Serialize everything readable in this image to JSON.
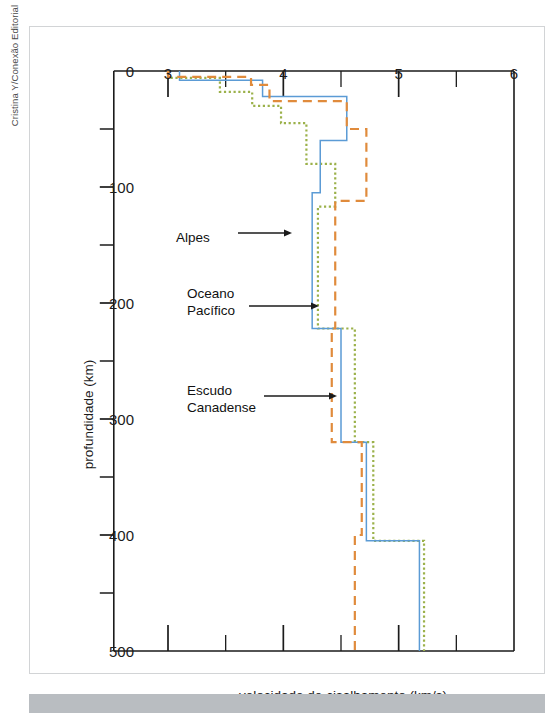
{
  "credit": "Cristina Y/Conexão Editorial",
  "chart_data": {
    "type": "line",
    "title": "",
    "xlabel": "velocidade de cisalhamento (km/s)",
    "ylabel": "profundidade (km)",
    "xlim": [
      2.53,
      6.0
    ],
    "ylim": [
      0,
      500
    ],
    "y_inverted": true,
    "x_axis_position": "top",
    "grid": false,
    "legend_position": "inline-annotations",
    "xticks": [
      3,
      4,
      5,
      6
    ],
    "xtick_labels": [
      "3",
      "4",
      "5",
      "6"
    ],
    "x_minor_ticks": [
      3.5,
      4.5,
      5.5
    ],
    "yticks": [
      0,
      100,
      200,
      300,
      400,
      500
    ],
    "ytick_labels": [
      "0",
      "100",
      "200",
      "300",
      "400",
      "500"
    ],
    "y_minor_ticks": [
      50,
      150,
      250,
      350,
      450
    ],
    "series": [
      {
        "name": "Alpes",
        "color": "#9bb14a",
        "style": "dotted",
        "points": [
          [
            3.0,
            0
          ],
          [
            3.0,
            6
          ],
          [
            3.45,
            6
          ],
          [
            3.45,
            18
          ],
          [
            3.73,
            18
          ],
          [
            3.73,
            30
          ],
          [
            3.98,
            30
          ],
          [
            3.98,
            45
          ],
          [
            4.2,
            45
          ],
          [
            4.2,
            80
          ],
          [
            4.45,
            80
          ],
          [
            4.45,
            117
          ],
          [
            4.3,
            117
          ],
          [
            4.3,
            222
          ],
          [
            4.62,
            222
          ],
          [
            4.62,
            320
          ],
          [
            4.78,
            320
          ],
          [
            4.78,
            405
          ],
          [
            5.22,
            405
          ],
          [
            5.22,
            500
          ]
        ]
      },
      {
        "name": "Oceano Pacífico",
        "color": "#5b9bd5",
        "style": "solid",
        "points": [
          [
            3.1,
            0
          ],
          [
            3.1,
            8
          ],
          [
            3.82,
            8
          ],
          [
            3.82,
            22
          ],
          [
            4.55,
            22
          ],
          [
            4.55,
            60
          ],
          [
            4.32,
            60
          ],
          [
            4.32,
            105
          ],
          [
            4.25,
            105
          ],
          [
            4.25,
            222
          ],
          [
            4.5,
            222
          ],
          [
            4.5,
            320
          ],
          [
            4.72,
            320
          ],
          [
            4.72,
            405
          ],
          [
            5.18,
            405
          ],
          [
            5.18,
            500
          ]
        ]
      },
      {
        "name": "Escudo Canadense",
        "color": "#e08b3c",
        "style": "dashed",
        "points": [
          [
            3.0,
            0
          ],
          [
            3.0,
            5
          ],
          [
            3.72,
            5
          ],
          [
            3.72,
            12
          ],
          [
            3.88,
            12
          ],
          [
            3.88,
            26
          ],
          [
            4.55,
            26
          ],
          [
            4.55,
            50
          ],
          [
            4.72,
            50
          ],
          [
            4.72,
            112
          ],
          [
            4.45,
            112
          ],
          [
            4.45,
            222
          ],
          [
            4.42,
            222
          ],
          [
            4.42,
            320
          ],
          [
            4.68,
            320
          ],
          [
            4.68,
            400
          ],
          [
            4.62,
            400
          ],
          [
            4.62,
            500
          ]
        ]
      }
    ],
    "annotations": [
      {
        "text": "Alpes",
        "target_series": "Alpes",
        "x_px": 175,
        "y_px": 229
      },
      {
        "text": "Oceano\nPacífico",
        "target_series": "Oceano Pacífico",
        "x_px": 186,
        "y_px": 285
      },
      {
        "text": "Escudo\nCanadense",
        "target_series": "Escudo Canadense",
        "x_px": 186,
        "y_px": 382
      }
    ]
  }
}
